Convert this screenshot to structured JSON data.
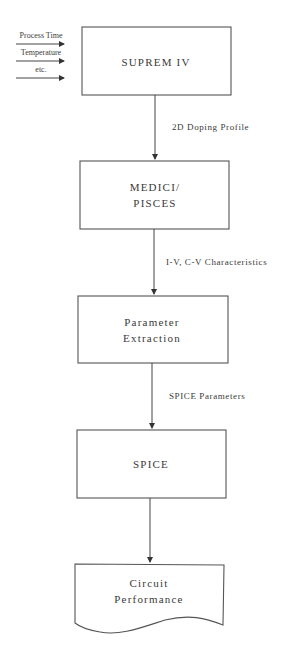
{
  "inputs": [
    {
      "label": "Process Time"
    },
    {
      "label": "Temperature"
    },
    {
      "label": "etc."
    }
  ],
  "nodes": [
    {
      "id": "suprem",
      "lines": [
        "SUPREM IV"
      ],
      "shape": "rectangle"
    },
    {
      "id": "medici",
      "lines": [
        "MEDICI/",
        "PISCES"
      ],
      "shape": "rectangle"
    },
    {
      "id": "param",
      "lines": [
        "Parameter",
        "Extraction"
      ],
      "shape": "rectangle"
    },
    {
      "id": "spice",
      "lines": [
        "SPICE"
      ],
      "shape": "rectangle"
    },
    {
      "id": "circuit",
      "lines": [
        "Circuit",
        "Performance"
      ],
      "shape": "document"
    }
  ],
  "edges": [
    {
      "from": "suprem",
      "to": "medici",
      "label": "2D Doping Profile"
    },
    {
      "from": "medici",
      "to": "param",
      "label": "I-V, C-V Characteristics"
    },
    {
      "from": "param",
      "to": "spice",
      "label": "SPICE Parameters"
    },
    {
      "from": "spice",
      "to": "circuit",
      "label": ""
    }
  ],
  "colors": {
    "stroke": "#555555",
    "text": "#3a3a3a",
    "background": "#ffffff"
  }
}
